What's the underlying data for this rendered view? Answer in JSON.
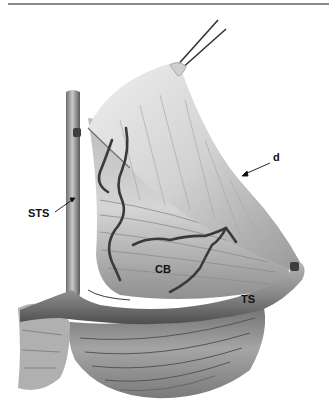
{
  "figure": {
    "type": "anatomical-illustration",
    "style": "grayscale",
    "labels": {
      "d": "d",
      "sts": "STS",
      "cb": "CB",
      "ts": "TS"
    },
    "colors": {
      "background": "#ffffff",
      "tissue_light": "#d9d9d9",
      "tissue_mid": "#a8a8a8",
      "tissue_dark": "#5a5a5a",
      "vessel": "#3a3a3a",
      "rule": "#8a8a8a"
    }
  }
}
